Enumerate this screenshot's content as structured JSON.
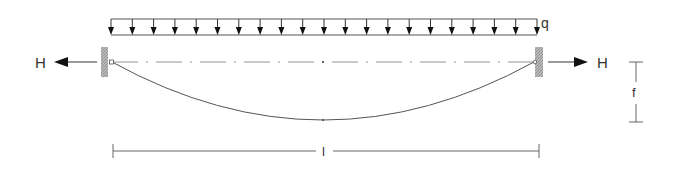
{
  "diagram": {
    "type": "cable under uniformly distributed load",
    "labels": {
      "load": "q",
      "horizontal_force_left": "H",
      "horizontal_force_right": "H",
      "sag": "f",
      "span": "l"
    },
    "load": {
      "arrow_count": 21,
      "x_start": 111,
      "x_end": 537,
      "y_top": 19,
      "y_bottom": 35
    },
    "supports": [
      {
        "side": "left",
        "x": 101,
        "width": 7,
        "y": 47,
        "height": 30
      },
      {
        "side": "right",
        "x": 535,
        "width": 8,
        "y": 47,
        "height": 30
      }
    ],
    "cable": {
      "left_anchor": [
        112,
        62
      ],
      "right_anchor": [
        534,
        62
      ],
      "lowest_point": [
        323,
        120
      ]
    },
    "colors": {
      "line": "#555555",
      "arrow": "#111111",
      "support": "#a8a8a8",
      "text": "#333333"
    }
  }
}
